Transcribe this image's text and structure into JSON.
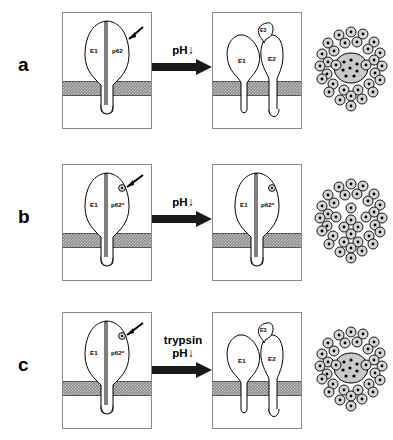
{
  "figure": {
    "type": "diagram",
    "rows": [
      {
        "id": "a",
        "letter": "a",
        "left_panel": {
          "name": "native-spike-panel",
          "labels": [
            "E1",
            "p62"
          ],
          "pointer": true,
          "marker": false,
          "state": "heterodimer-closed"
        },
        "arrow": {
          "lines": [
            "pH"
          ],
          "has_down_arrow": true,
          "down_glyph": "↓"
        },
        "mid_panel": {
          "name": "dissociated-spike-panel",
          "labels": [
            "E1",
            "E2",
            "E3"
          ],
          "pointer": false,
          "marker": false,
          "state": "dissociated"
        },
        "cluster": {
          "name": "virus-particle-cluster",
          "core": true,
          "particles": 36
        }
      },
      {
        "id": "b",
        "letter": "b",
        "left_panel": {
          "name": "native-spike-panel",
          "labels": [
            "E1",
            "p62*"
          ],
          "pointer": true,
          "marker": true,
          "state": "heterodimer-closed"
        },
        "arrow": {
          "lines": [
            "pH"
          ],
          "has_down_arrow": true,
          "down_glyph": "↓"
        },
        "mid_panel": {
          "name": "unchanged-spike-panel",
          "labels": [
            "E1",
            "p62*"
          ],
          "pointer": false,
          "marker": true,
          "state": "heterodimer-closed"
        },
        "cluster": {
          "name": "virus-particle-cluster",
          "core": false,
          "particles": 36
        }
      },
      {
        "id": "c",
        "letter": "c",
        "left_panel": {
          "name": "native-spike-panel",
          "labels": [
            "E1",
            "p62*"
          ],
          "pointer": true,
          "marker": true,
          "state": "heterodimer-closed"
        },
        "arrow": {
          "lines": [
            "trypsin",
            "pH"
          ],
          "has_down_arrow": true,
          "down_glyph": "↓"
        },
        "mid_panel": {
          "name": "dissociated-spike-panel",
          "labels": [
            "E1",
            "E2",
            "E3"
          ],
          "pointer": false,
          "marker": false,
          "state": "dissociated"
        },
        "cluster": {
          "name": "virus-particle-cluster",
          "core": true,
          "particles": 36
        }
      }
    ],
    "colors": {
      "membrane": "#8c8c8c",
      "panel_border": "#8a8a8a",
      "arrow": "#1a1a1a",
      "particle_fill": "#d6d6d6",
      "core_fill": "#c9c9c9",
      "outline": "#000000"
    }
  }
}
